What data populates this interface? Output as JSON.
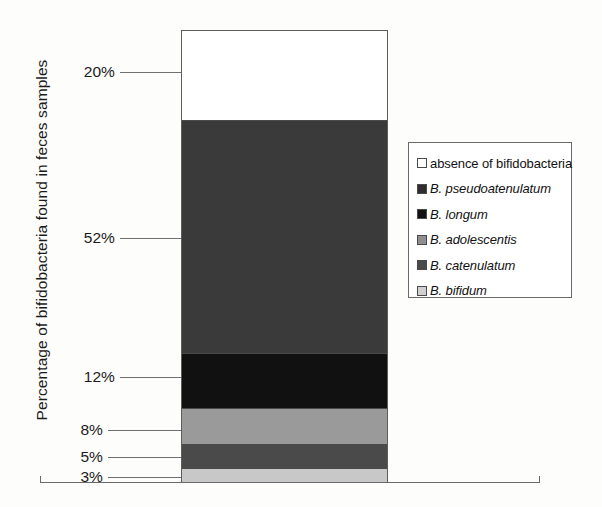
{
  "chart_data": {
    "type": "bar",
    "subtype": "stacked-column-100",
    "title": "",
    "xlabel": "",
    "ylabel": "Percentage of bifidobacteria found in feces samples",
    "ylim": [
      0,
      100
    ],
    "grid": false,
    "legend_position": "right",
    "categories": [
      "feces samples"
    ],
    "stack_order_top_to_bottom": [
      "absence of bifidobacteria",
      "B. pseudoatenulatum",
      "B. longum",
      "B. adolescentis",
      "B. catenulatum",
      "B. bifidum"
    ],
    "series": [
      {
        "name": "absence of bifidobacteria",
        "values": [
          20
        ],
        "color": "#ffffff"
      },
      {
        "name": "B. pseudoatenulatum",
        "values": [
          52
        ],
        "color": "#3a3a3a"
      },
      {
        "name": "B. longum",
        "values": [
          12
        ],
        "color": "#111111"
      },
      {
        "name": "B. adolescentis",
        "values": [
          8
        ],
        "color": "#9a9a9a"
      },
      {
        "name": "B. catenulatum",
        "values": [
          5
        ],
        "color": "#4a4a4a"
      },
      {
        "name": "B. bifidum",
        "values": [
          3
        ],
        "color": "#c8c8c8"
      }
    ],
    "data_labels": [
      "20%",
      "52%",
      "12%",
      "8%",
      "5%",
      "3%"
    ]
  },
  "axis": {
    "y_title": "Percentage of bifidobacteria found in feces samples",
    "ticks": [
      {
        "label": "20%",
        "value": 20,
        "top": 62,
        "leader_width": 112
      },
      {
        "label": "52%",
        "value": 52,
        "top": 228,
        "leader_width": 112
      },
      {
        "label": "12%",
        "value": 12,
        "top": 367,
        "leader_width": 112
      },
      {
        "label": "8%",
        "value": 8,
        "top": 420,
        "leader_width": 124
      },
      {
        "label": "5%",
        "value": 5,
        "top": 447,
        "leader_width": 124
      },
      {
        "label": "3%",
        "value": 3,
        "top": 467,
        "leader_width": 124
      }
    ]
  },
  "legend": {
    "items": [
      {
        "label": "absence of bifidobacteria",
        "color": "#ffffff",
        "italic": false
      },
      {
        "label": "B. pseudoatenulatum",
        "color": "#2e2e2e",
        "italic": true
      },
      {
        "label": "B. longum",
        "color": "#111111",
        "italic": true
      },
      {
        "label": "B. adolescentis",
        "color": "#8f8f8f",
        "italic": true
      },
      {
        "label": "B. catenulatum",
        "color": "#4a4a4a",
        "italic": true
      },
      {
        "label": "B. bifidum",
        "color": "#cfcfcf",
        "italic": true
      }
    ]
  }
}
